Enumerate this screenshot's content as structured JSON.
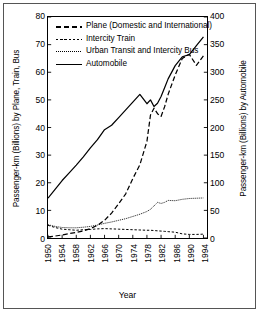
{
  "chart_data": {
    "type": "line",
    "title": "",
    "xlabel": "Year",
    "ylabel": "Passenger-km (Billions) by Plane, Train, Bus",
    "ylabel_right": "Passenger-km (Billions) by Automobile",
    "x": [
      1950,
      1952,
      1954,
      1956,
      1958,
      1960,
      1962,
      1964,
      1966,
      1968,
      1970,
      1972,
      1974,
      1976,
      1978,
      1979,
      1980,
      1981,
      1982,
      1983,
      1984,
      1986,
      1988,
      1990,
      1992,
      1994
    ],
    "xlim": [
      1950,
      1995
    ],
    "xticks": [
      "1950",
      "1954",
      "1958",
      "1962",
      "1966",
      "1970",
      "1974",
      "1978",
      "1982",
      "1986",
      "1990",
      "1994"
    ],
    "ylim": [
      0,
      80
    ],
    "yticks": [
      "0",
      "10",
      "20",
      "30",
      "40",
      "50",
      "60",
      "70",
      "80"
    ],
    "ylim_right": [
      0,
      400
    ],
    "yticks_right": [
      "0",
      "50",
      "100",
      "150",
      "200",
      "250",
      "300",
      "350",
      "400"
    ],
    "grid": false,
    "legend_position": "upper left",
    "series": [
      {
        "name": "Plane (Domestic and International)",
        "axis": "left",
        "style": "long-dash",
        "values": [
          0.4,
          0.7,
          1.1,
          1.6,
          2.0,
          2.6,
          3.4,
          4.6,
          6.4,
          9.0,
          12.4,
          16.0,
          21.5,
          26.5,
          35.0,
          44.5,
          47.0,
          45.0,
          44.0,
          47.5,
          52.0,
          59.0,
          65.0,
          66.5,
          62.5,
          66.0
        ]
      },
      {
        "name": "Intercity Train",
        "axis": "left",
        "style": "short-dash",
        "values": [
          4.6,
          3.8,
          3.2,
          3.0,
          2.8,
          3.0,
          3.1,
          3.3,
          3.4,
          3.3,
          3.2,
          3.1,
          3.0,
          2.9,
          2.8,
          2.8,
          2.7,
          2.6,
          2.5,
          2.4,
          2.3,
          2.1,
          1.5,
          1.3,
          1.3,
          1.4
        ]
      },
      {
        "name": "Urban Transit and Intercity Bus",
        "axis": "left",
        "style": "dotted-thin",
        "values": [
          4.8,
          4.2,
          3.8,
          3.7,
          3.7,
          3.9,
          4.2,
          4.7,
          5.3,
          5.8,
          6.4,
          7.0,
          7.8,
          8.6,
          9.6,
          10.4,
          11.6,
          12.9,
          12.5,
          12.9,
          13.6,
          13.5,
          14.0,
          14.3,
          14.4,
          14.5
        ]
      },
      {
        "name": "Automobile",
        "axis": "right",
        "style": "solid",
        "values": [
          72,
          88,
          104,
          118,
          132,
          147,
          163,
          178,
          196,
          204,
          218,
          232,
          246,
          260,
          243,
          250,
          238,
          244,
          256,
          272,
          288,
          312,
          328,
          332,
          348,
          364
        ]
      }
    ]
  },
  "axes": {
    "left_title": "Passenger-km (Billions) by Plane, Train, Bus",
    "right_title": "Passenger-km (Billions) by Automobile",
    "x_title": "Year"
  },
  "legend": {
    "items": [
      {
        "label": "Plane (Domestic and International)",
        "key": "long-dash-key"
      },
      {
        "label": "Intercity Train",
        "key": "short-dash-key"
      },
      {
        "label": "Urban Transit and Intercity Bus",
        "key": "dotted-key"
      },
      {
        "label": "Automobile",
        "key": "solid-key"
      }
    ]
  },
  "colors": {
    "line": "#000000",
    "frame": "#000000",
    "border": "#555555",
    "background": "#ffffff"
  }
}
